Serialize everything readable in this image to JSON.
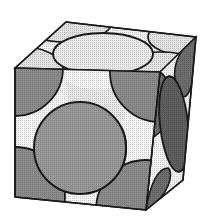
{
  "diagram": {
    "title": "Face-centered cubic unit cell (hard-sphere model)",
    "colors": {
      "background": "#ffffff",
      "outline": "#1a1a1a",
      "light_face_sphere": "#e6e6e6",
      "medium_sphere": "#9a9a9a",
      "dark_sphere": "#7a7a7a",
      "side_face_sphere": "#6e6e6e",
      "gap": "#f4f4f4"
    },
    "cube": {
      "front_top_left": [
        15,
        68
      ],
      "front_top_right": [
        160,
        72
      ],
      "front_bottom_right": [
        146,
        210
      ],
      "front_bottom_left": [
        15,
        197
      ],
      "back_top_left": [
        66,
        22
      ],
      "back_top_right": [
        196,
        37
      ],
      "back_bottom_right": [
        183,
        180
      ]
    },
    "spheres": [
      {
        "name": "front-face-center",
        "shape": "circle",
        "cx": 80,
        "cy": 148,
        "r": 46
      },
      {
        "name": "top-face-center",
        "shape": "ellipse",
        "cx": 103,
        "cy": 54,
        "rx": 50,
        "ry": 20
      },
      {
        "name": "right-face-center",
        "shape": "ellipse",
        "cx": 175,
        "cy": 124,
        "rx": 14,
        "ry": 48
      }
    ]
  }
}
